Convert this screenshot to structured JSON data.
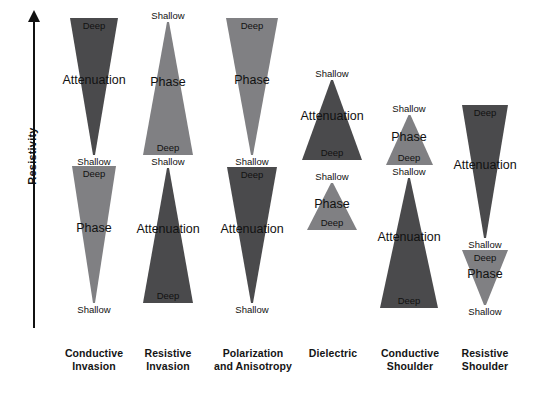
{
  "axis": {
    "label": "Resistivity",
    "direction": "up"
  },
  "colors": {
    "attenuation_dark": "#4a4a4c",
    "phase_medium": "#808083",
    "text": "#111111",
    "background": "#ffffff"
  },
  "terms": {
    "deep": "Deep",
    "shallow": "Shallow",
    "attenuation": "Attenuation",
    "phase": "Phase"
  },
  "columns": [
    {
      "id": "conductive-invasion",
      "caption_line1": "Conductive",
      "caption_line2": "Invasion",
      "shapes": [
        {
          "measurement": "Attenuation",
          "color": "dark",
          "orientation": "down",
          "top_label": "Deep",
          "bottom_label": "Shallow"
        },
        {
          "measurement": "Phase",
          "color": "medium",
          "orientation": "down",
          "top_label": "Deep",
          "bottom_label": "Shallow"
        }
      ]
    },
    {
      "id": "resistive-invasion",
      "caption_line1": "Resistive",
      "caption_line2": "Invasion",
      "shapes": [
        {
          "measurement": "Phase",
          "color": "medium",
          "orientation": "up",
          "top_label": "Shallow",
          "bottom_label": "Deep"
        },
        {
          "measurement": "Attenuation",
          "color": "dark",
          "orientation": "up",
          "top_label": "Shallow",
          "bottom_label": "Deep"
        }
      ]
    },
    {
      "id": "polarization-and-anisotropy",
      "caption_line1": "Polarization",
      "caption_line2": "and Anisotropy",
      "shapes": [
        {
          "measurement": "Phase",
          "color": "medium",
          "orientation": "down",
          "top_label": "Deep",
          "bottom_label": "Shallow"
        },
        {
          "measurement": "Attenuation",
          "color": "dark",
          "orientation": "down",
          "top_label": "Deep",
          "bottom_label": "Shallow"
        }
      ]
    },
    {
      "id": "dielectric",
      "caption_line1": "Dielectric",
      "caption_line2": "",
      "shapes": [
        {
          "measurement": "Attenuation",
          "color": "dark",
          "orientation": "up",
          "top_label": "Shallow",
          "bottom_label": "Deep"
        },
        {
          "measurement": "Phase",
          "color": "medium",
          "orientation": "up",
          "top_label": "Shallow",
          "bottom_label": "Deep"
        }
      ]
    },
    {
      "id": "conductive-shoulder",
      "caption_line1": "Conductive",
      "caption_line2": "Shoulder",
      "shapes": [
        {
          "measurement": "Phase",
          "color": "medium",
          "orientation": "up",
          "top_label": "Shallow",
          "bottom_label": "Deep"
        },
        {
          "measurement": "Attenuation",
          "color": "dark",
          "orientation": "up",
          "top_label": "Shallow",
          "bottom_label": "Deep"
        }
      ]
    },
    {
      "id": "resistive-shoulder",
      "caption_line1": "Resistive",
      "caption_line2": "Shoulder",
      "shapes": [
        {
          "measurement": "Attenuation",
          "color": "dark",
          "orientation": "down",
          "top_label": "Deep",
          "bottom_label": "Shallow"
        },
        {
          "measurement": "Phase",
          "color": "medium",
          "orientation": "down",
          "top_label": "Deep",
          "bottom_label": "Shallow"
        }
      ]
    }
  ]
}
